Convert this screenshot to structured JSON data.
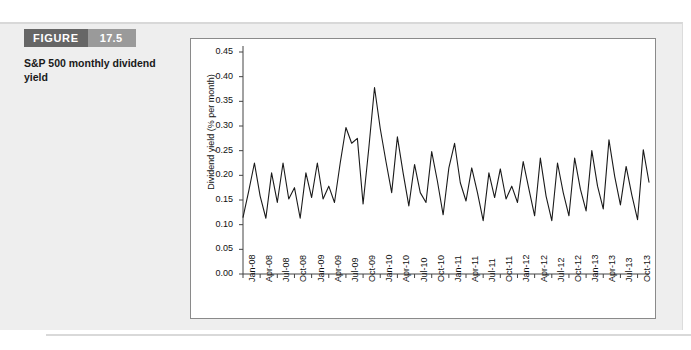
{
  "figure": {
    "label": "FIGURE",
    "number": "17.5",
    "caption": "S&P 500 monthly dividend yield",
    "label_bg": "#666666",
    "number_bg": "#9a9a9a",
    "panel_bg": "#eeeeee"
  },
  "chart_data": {
    "type": "line",
    "title": "",
    "xlabel": "",
    "ylabel": "Dividend yield (% per month)",
    "ylim": [
      0.0,
      0.45
    ],
    "ytick_labels": [
      "0.00",
      "0.05",
      "0.10",
      "0.15",
      "0.20",
      "0.25",
      "0.30",
      "0.35",
      "0.40",
      "0.45"
    ],
    "ytick_values": [
      0.0,
      0.05,
      0.1,
      0.15,
      0.2,
      0.25,
      0.3,
      0.35,
      0.4,
      0.45
    ],
    "grid": false,
    "legend": "none",
    "line_color": "#1a1a1a",
    "xtick_labels": [
      "Jan-08",
      "Apr-08",
      "Jul-08",
      "Oct-08",
      "Jan-09",
      "Apr-09",
      "Jul-09",
      "Oct-09",
      "Jan-10",
      "Apr-10",
      "Jul-10",
      "Oct-10",
      "Jan-11",
      "Apr-11",
      "Jul-11",
      "Oct-11",
      "Jan-12",
      "Apr-12",
      "Jul-12",
      "Oct-12",
      "Jan-13",
      "Apr-13",
      "Jul-13",
      "Oct-13"
    ],
    "xtick_step_months": 3,
    "x": [
      "Jan-08",
      "Feb-08",
      "Mar-08",
      "Apr-08",
      "May-08",
      "Jun-08",
      "Jul-08",
      "Aug-08",
      "Sep-08",
      "Oct-08",
      "Nov-08",
      "Dec-08",
      "Jan-09",
      "Feb-09",
      "Mar-09",
      "Apr-09",
      "May-09",
      "Jun-09",
      "Jul-09",
      "Aug-09",
      "Sep-09",
      "Oct-09",
      "Nov-09",
      "Dec-09",
      "Jan-10",
      "Feb-10",
      "Mar-10",
      "Apr-10",
      "May-10",
      "Jun-10",
      "Jul-10",
      "Aug-10",
      "Sep-10",
      "Oct-10",
      "Nov-10",
      "Dec-10",
      "Jan-11",
      "Feb-11",
      "Mar-11",
      "Apr-11",
      "May-11",
      "Jun-11",
      "Jul-11",
      "Aug-11",
      "Sep-11",
      "Oct-11",
      "Nov-11",
      "Dec-11",
      "Jan-12",
      "Feb-12",
      "Mar-12",
      "Apr-12",
      "May-12",
      "Jun-12",
      "Jul-12",
      "Aug-12",
      "Sep-12",
      "Oct-12",
      "Nov-12",
      "Dec-12",
      "Jan-13",
      "Feb-13",
      "Mar-13",
      "Apr-13",
      "May-13",
      "Jun-13",
      "Jul-13",
      "Aug-13",
      "Sep-13",
      "Oct-13",
      "Nov-13",
      "Dec-13"
    ],
    "values": [
      0.115,
      0.168,
      0.225,
      0.158,
      0.113,
      0.205,
      0.145,
      0.225,
      0.152,
      0.175,
      0.113,
      0.205,
      0.155,
      0.225,
      0.152,
      0.178,
      0.145,
      0.225,
      0.297,
      0.265,
      0.275,
      0.142,
      0.255,
      0.378,
      0.295,
      0.228,
      0.165,
      0.278,
      0.205,
      0.138,
      0.222,
      0.165,
      0.145,
      0.248,
      0.188,
      0.12,
      0.215,
      0.265,
      0.185,
      0.148,
      0.215,
      0.165,
      0.108,
      0.205,
      0.155,
      0.213,
      0.152,
      0.178,
      0.145,
      0.228,
      0.172,
      0.118,
      0.235,
      0.158,
      0.108,
      0.225,
      0.165,
      0.118,
      0.235,
      0.172,
      0.128,
      0.25,
      0.178,
      0.132,
      0.272,
      0.198,
      0.14,
      0.218,
      0.16,
      0.11,
      0.252,
      0.186
    ]
  }
}
